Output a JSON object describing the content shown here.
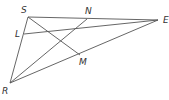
{
  "diagram": {
    "type": "geometry-figure",
    "points": {
      "S": {
        "label": "S",
        "x": 28,
        "y": 17,
        "label_x": 21,
        "label_y": 13
      },
      "N": {
        "label": "N",
        "x": 87,
        "y": 19,
        "label_x": 87,
        "label_y": 14
      },
      "E": {
        "label": "E",
        "x": 158,
        "y": 20,
        "label_x": 163,
        "label_y": 23
      },
      "L": {
        "label": "L",
        "x": 24,
        "y": 34,
        "label_x": 16,
        "label_y": 37
      },
      "M": {
        "label": "M",
        "x": 80,
        "y": 55,
        "label_x": 80,
        "label_y": 65
      },
      "R": {
        "label": "R",
        "x": 10,
        "y": 83,
        "label_x": 2,
        "label_y": 94
      }
    },
    "segments": [
      {
        "from": "S",
        "to": "E"
      },
      {
        "from": "S",
        "to": "R"
      },
      {
        "from": "R",
        "to": "E"
      },
      {
        "from": "S",
        "to": "M"
      },
      {
        "from": "R",
        "to": "N"
      },
      {
        "from": "L",
        "to": "E"
      }
    ],
    "line_color": "#555555",
    "label_color": "#333333"
  }
}
